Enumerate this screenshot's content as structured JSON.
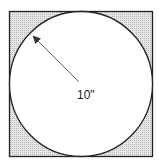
{
  "diagram": {
    "type": "circle-inscribed-in-square",
    "radius_label": "10\"",
    "shading": "shaded corner regions outside circle",
    "colors": {
      "stroke": "#222222",
      "shade": "#d4d4d4",
      "circle_fill": "#ffffff",
      "arrow": "#555555"
    }
  }
}
